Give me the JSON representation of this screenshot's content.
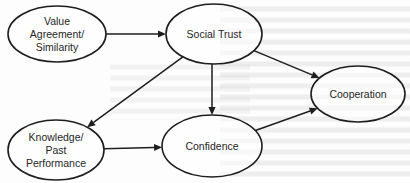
{
  "diagram": {
    "type": "causal-model",
    "nodes": [
      {
        "id": "value_agreement",
        "lines": [
          "Value",
          "Agreement/",
          "Similarity"
        ]
      },
      {
        "id": "social_trust",
        "lines": [
          "Social Trust"
        ]
      },
      {
        "id": "cooperation",
        "lines": [
          "Cooperation"
        ]
      },
      {
        "id": "knowledge",
        "lines": [
          "Knowledge/",
          "Past",
          "Performance"
        ]
      },
      {
        "id": "confidence",
        "lines": [
          "Confidence"
        ]
      }
    ],
    "edges": [
      {
        "from": "value_agreement",
        "to": "social_trust"
      },
      {
        "from": "social_trust",
        "to": "cooperation"
      },
      {
        "from": "social_trust",
        "to": "knowledge"
      },
      {
        "from": "social_trust",
        "to": "confidence"
      },
      {
        "from": "knowledge",
        "to": "confidence"
      },
      {
        "from": "confidence",
        "to": "cooperation"
      }
    ]
  },
  "colors": {
    "stroke": "#1e1e1e",
    "text": "#262626",
    "background": "#fdfdfd"
  }
}
